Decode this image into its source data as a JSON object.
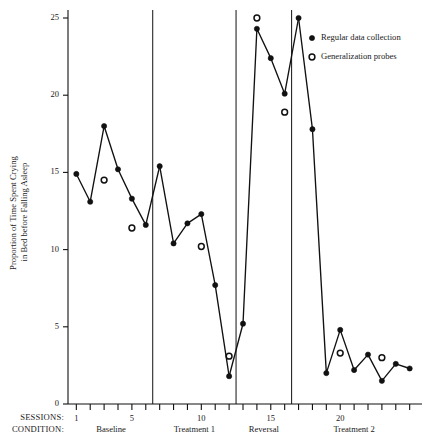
{
  "chart_data": {
    "type": "line",
    "title": "",
    "xlabel": "SESSIONS",
    "ylabel": "Proportion of Time Spent Crying in Bed before Falling Asleep",
    "ylabel_line1": "Proportion of Time Spent Crying",
    "ylabel_line2": "in Bed before Falling Asleep",
    "ylim": [
      0,
      25
    ],
    "yticks": [
      0,
      5,
      10,
      15,
      20,
      25
    ],
    "ytick_labels": [
      "0",
      "5",
      "10",
      "15",
      "20",
      "25"
    ],
    "xlim": [
      0.4,
      25.6
    ],
    "xticks": [
      1,
      2,
      3,
      4,
      5,
      6,
      7,
      8,
      9,
      10,
      11,
      12,
      13,
      14,
      15,
      16,
      17,
      18,
      19,
      20,
      21,
      22,
      23,
      24,
      25
    ],
    "xtick_labels_shown": [
      {
        "x": 1,
        "label": "1"
      },
      {
        "x": 5,
        "label": "5"
      },
      {
        "x": 10,
        "label": "10"
      },
      {
        "x": 15,
        "label": "15"
      },
      {
        "x": 20,
        "label": "20"
      }
    ],
    "grid": false,
    "legend_position": "top-right",
    "series": [
      {
        "name": "Regular data collection",
        "marker": "filled-circle",
        "connected": true,
        "segments": [
          {
            "phase": "Baseline",
            "points": [
              {
                "x": 1,
                "y": 14.9
              },
              {
                "x": 2,
                "y": 13.1
              },
              {
                "x": 3,
                "y": 18.0
              },
              {
                "x": 4,
                "y": 15.2
              },
              {
                "x": 5,
                "y": 13.3
              },
              {
                "x": 6,
                "y": 11.6
              }
            ]
          },
          {
            "phase": "Treatment 1",
            "points": [
              {
                "x": 7,
                "y": 15.4
              },
              {
                "x": 8,
                "y": 10.4
              },
              {
                "x": 9,
                "y": 11.7
              },
              {
                "x": 10,
                "y": 12.3
              },
              {
                "x": 11,
                "y": 7.7
              },
              {
                "x": 12,
                "y": 1.8
              }
            ]
          },
          {
            "phase": "Reversal",
            "points": [
              {
                "x": 13,
                "y": 5.2
              },
              {
                "x": 14,
                "y": 24.3
              },
              {
                "x": 15,
                "y": 22.4
              },
              {
                "x": 16,
                "y": 20.1
              }
            ]
          },
          {
            "phase": "Treatment 2",
            "points": [
              {
                "x": 17,
                "y": 25.0
              },
              {
                "x": 18,
                "y": 17.8
              },
              {
                "x": 19,
                "y": 2.0
              },
              {
                "x": 20,
                "y": 4.8
              },
              {
                "x": 21,
                "y": 2.2
              },
              {
                "x": 22,
                "y": 3.2
              },
              {
                "x": 23,
                "y": 1.5
              },
              {
                "x": 24,
                "y": 2.6
              },
              {
                "x": 25,
                "y": 2.3
              }
            ]
          }
        ]
      },
      {
        "name": "Generalization probes",
        "marker": "open-circle",
        "connected": false,
        "points": [
          {
            "x": 3,
            "y": 14.5
          },
          {
            "x": 5,
            "y": 11.4
          },
          {
            "x": 10,
            "y": 10.2
          },
          {
            "x": 12,
            "y": 3.1
          },
          {
            "x": 14,
            "y": 25.0
          },
          {
            "x": 16,
            "y": 18.9
          },
          {
            "x": 20,
            "y": 3.3
          },
          {
            "x": 23,
            "y": 3.0
          }
        ]
      }
    ],
    "phase_lines_x": [
      6.5,
      12.5,
      16.5
    ],
    "phases": [
      {
        "label": "Baseline",
        "start": 1,
        "end": 6
      },
      {
        "label": "Treatment 1",
        "start": 7,
        "end": 12
      },
      {
        "label": "Reversal",
        "start": 13,
        "end": 16
      },
      {
        "label": "Treatment 2",
        "start": 17,
        "end": 25
      }
    ],
    "annotations": []
  },
  "axis_rows": {
    "sessions_label": "SESSIONS:",
    "condition_label": "CONDITION:"
  },
  "legend": {
    "items": [
      {
        "marker": "filled-circle",
        "label": "Regular data collection"
      },
      {
        "marker": "open-circle",
        "label": "Generalization probes"
      }
    ]
  },
  "colors": {
    "ink": "#111111",
    "background": "#ffffff"
  }
}
